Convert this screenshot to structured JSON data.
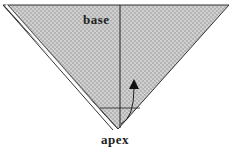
{
  "diagram": {
    "type": "origami-fold-step",
    "labels": {
      "base": "base",
      "apex": "apex"
    },
    "colors": {
      "paper_fill": "#b8b8b8",
      "paper_dots": "#e0e0e0",
      "line": "#222222",
      "flap_edge": "#ffffff"
    },
    "annotations": {
      "center_crease": "vertical line from base to apex",
      "fold_line": "horizontal dashed crease near apex",
      "arrow": "curved arrow indicating folding apex upward"
    }
  }
}
